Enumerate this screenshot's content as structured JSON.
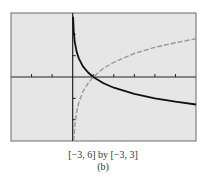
{
  "chart_data": {
    "type": "line",
    "title": "",
    "xlabel": "",
    "ylabel": "",
    "xlim": [
      -3,
      6
    ],
    "ylim": [
      -3,
      3
    ],
    "x_ticks": [
      -3,
      -2,
      -1,
      0,
      1,
      2,
      3,
      4,
      5,
      6
    ],
    "y_ticks": [
      -3,
      -2,
      -1,
      0,
      1,
      2,
      3
    ],
    "grid": false,
    "legend": null,
    "background": "#e6e6e6",
    "series": [
      {
        "name": "solid curve (decreasing logarithm)",
        "style": "solid",
        "color": "#111111",
        "x": [
          0.02,
          0.05,
          0.1,
          0.2,
          0.3,
          0.5,
          0.75,
          1,
          1.5,
          2,
          3,
          4,
          5,
          6
        ],
        "y": [
          2.82,
          2.16,
          1.66,
          1.16,
          0.87,
          0.5,
          0.21,
          0,
          -0.29,
          -0.5,
          -0.79,
          -1.0,
          -1.16,
          -1.29
        ]
      },
      {
        "name": "dashed curve (increasing logarithm)",
        "style": "dashed",
        "color": "#999999",
        "x": [
          0.05,
          0.1,
          0.2,
          0.3,
          0.5,
          0.75,
          1,
          1.5,
          2,
          3,
          4,
          5,
          6
        ],
        "y": [
          -3.0,
          -2.3,
          -1.61,
          -1.2,
          -0.69,
          -0.29,
          0,
          0.41,
          0.69,
          1.1,
          1.39,
          1.61,
          1.79
        ]
      }
    ]
  },
  "caption": {
    "window": "[−3, 6] by [−3, 3]",
    "label": "(b)"
  }
}
